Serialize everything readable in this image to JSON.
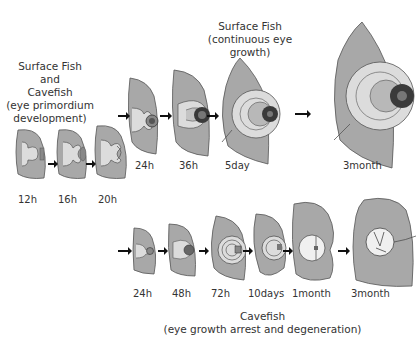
{
  "titles": {
    "shared": [
      "Surface Fish",
      "and",
      "Cavefish",
      "(eye primordium",
      "development)"
    ],
    "surface": [
      "Surface Fish",
      "(continuous eye growth)"
    ],
    "cavefish": [
      "Cavefish",
      "(eye growth arrest and degeneration)"
    ]
  },
  "stages": {
    "shared": [
      "12h",
      "16h",
      "20h"
    ],
    "surface": [
      "24h",
      "36h",
      "5day",
      "3month"
    ],
    "cavefish": [
      "24h",
      "48h",
      "72h",
      "10days",
      "1month",
      "3month"
    ]
  },
  "colors": {
    "head": "#a8a8a8",
    "eye_light": "#dcdcdc",
    "lens": "#3a3a3a",
    "outline": "#555555",
    "arrow": "#111111"
  }
}
